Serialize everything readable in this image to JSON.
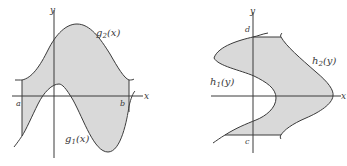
{
  "figure_left": {
    "axis_x_label": "x",
    "axis_y_label": "y",
    "bound_a": "a",
    "bound_b": "b",
    "upper_curve": {
      "name": "g",
      "sub": "2",
      "arg": "(x)"
    },
    "lower_curve": {
      "name": "g",
      "sub": "1",
      "arg": "(x)"
    },
    "description": "Region between g2(x) above and g1(x) below for a ≤ x ≤ b"
  },
  "figure_right": {
    "axis_x_label": "x",
    "axis_y_label": "y",
    "bound_c": "c",
    "bound_d": "d",
    "left_curve": {
      "name": "h",
      "sub": "1",
      "arg": "(y)"
    },
    "right_curve": {
      "name": "h",
      "sub": "2",
      "arg": "(y)"
    },
    "description": "Region between h1(y) on left and h2(y) on right for c ≤ y ≤ d"
  },
  "colors": {
    "fill": "#d9d9d9",
    "stroke": "#3a3a3a",
    "background": "#ffffff"
  }
}
